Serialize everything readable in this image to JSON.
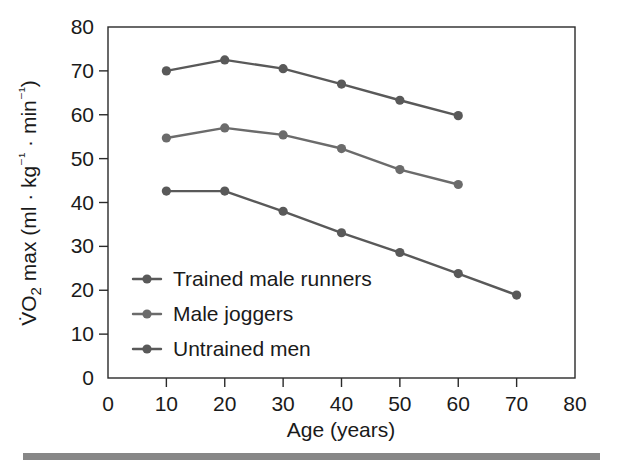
{
  "chart_data": {
    "type": "line",
    "title": "",
    "xlabel": "Age (years)",
    "ylabel": "V̇O₂ max (ml · kg⁻¹ · min⁻¹)",
    "ylabel_parts": {
      "prefix": "V",
      "dot": "̇",
      "o": "O",
      "sub2": "2",
      "mid": " max (ml · kg",
      "sup_neg1_a": "⁻¹",
      "mid2": " · min",
      "sup_neg1_b": "⁻¹",
      "suffix": ")"
    },
    "xlim": [
      0,
      80
    ],
    "ylim": [
      0,
      80
    ],
    "xticks": [
      0,
      10,
      20,
      30,
      40,
      50,
      60,
      70,
      80
    ],
    "yticks": [
      0,
      10,
      20,
      30,
      40,
      50,
      60,
      70,
      80
    ],
    "xtick_labels": [
      "0",
      "10",
      "20",
      "30",
      "40",
      "50",
      "60",
      "70",
      "80"
    ],
    "ytick_labels": [
      "0",
      "10",
      "20",
      "30",
      "40",
      "50",
      "60",
      "70",
      "80"
    ],
    "grid": false,
    "legend_position": "inside-lower-left",
    "series": [
      {
        "name": "Trained male runners",
        "color": "#595959",
        "x": [
          10,
          20,
          30,
          40,
          50,
          60
        ],
        "values": [
          70.0,
          72.5,
          70.5,
          67.0,
          63.3,
          59.8
        ]
      },
      {
        "name": "Male joggers",
        "color": "#6b6b6b",
        "x": [
          10,
          20,
          30,
          40,
          50,
          60
        ],
        "values": [
          54.7,
          57.0,
          55.4,
          52.3,
          47.5,
          44.1
        ]
      },
      {
        "name": "Untrained men",
        "color": "#595959",
        "x": [
          10,
          20,
          30,
          40,
          50,
          60,
          70
        ],
        "values": [
          42.6,
          42.6,
          38.0,
          33.1,
          28.6,
          23.8,
          18.9
        ]
      }
    ]
  },
  "figure": {
    "background_color": "#ffffff",
    "axis_color": "#2a2a2a",
    "rule_color": "#878787"
  }
}
